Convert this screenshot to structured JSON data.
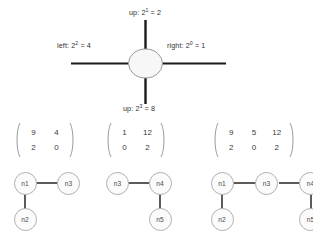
{
  "figure": {
    "hub": {
      "name": "center-node",
      "shape": "ellipse",
      "fill": "#f7f7f7",
      "stroke": "#9a9a9a"
    },
    "directions": [
      {
        "id": "up",
        "label": "up: 2",
        "exponent": "1",
        "equals": " = 2",
        "full_text": "up: 2¹ = 2"
      },
      {
        "id": "left",
        "label": "left: 2",
        "exponent": "2",
        "equals": " = 4",
        "full_text": "left: 2² = 4"
      },
      {
        "id": "right",
        "label": "right: 2",
        "exponent": "0",
        "equals": " = 1",
        "full_text": "right: 2⁰ = 1"
      },
      {
        "id": "down",
        "label": "up: 2",
        "exponent": "3",
        "equals": " = 8",
        "full_text": "up: 2³ = 8"
      }
    ],
    "arm_color": "#1a1a1a"
  },
  "matrices": [
    {
      "id": "matrix-1",
      "rows": 2,
      "cols": 2,
      "values": [
        [
          "9",
          "4"
        ],
        [
          "2",
          "0"
        ]
      ]
    },
    {
      "id": "matrix-2",
      "rows": 2,
      "cols": 2,
      "values": [
        [
          "1",
          "12"
        ],
        [
          "0",
          "2"
        ]
      ]
    },
    {
      "id": "matrix-3",
      "rows": 2,
      "cols": 3,
      "values": [
        [
          "9",
          "5",
          "12"
        ],
        [
          "2",
          "0",
          "2"
        ]
      ]
    }
  ],
  "graphs": [
    {
      "id": "graph-1",
      "nodes": [
        {
          "id": "g1-n1",
          "label": "n1"
        },
        {
          "id": "g1-n3",
          "label": "n3"
        },
        {
          "id": "g1-n2",
          "label": "n2"
        }
      ],
      "edges": [
        {
          "from": "n1",
          "to": "n3"
        },
        {
          "from": "n1",
          "to": "n2"
        }
      ]
    },
    {
      "id": "graph-2",
      "nodes": [
        {
          "id": "g2-n3",
          "label": "n3"
        },
        {
          "id": "g2-n4",
          "label": "n4"
        },
        {
          "id": "g2-n5",
          "label": "n5"
        }
      ],
      "edges": [
        {
          "from": "n3",
          "to": "n4"
        },
        {
          "from": "n4",
          "to": "n5"
        }
      ]
    },
    {
      "id": "graph-3",
      "nodes": [
        {
          "id": "g3-n1",
          "label": "n1"
        },
        {
          "id": "g3-n3",
          "label": "n3"
        },
        {
          "id": "g3-n4",
          "label": "n4"
        },
        {
          "id": "g3-n2",
          "label": "n2"
        },
        {
          "id": "g3-n5",
          "label": "n5"
        }
      ],
      "edges": [
        {
          "from": "n1",
          "to": "n3"
        },
        {
          "from": "n3",
          "to": "n4"
        },
        {
          "from": "n1",
          "to": "n2"
        },
        {
          "from": "n4",
          "to": "n5"
        }
      ]
    }
  ],
  "colors": {
    "node_fill": "#fbfbfb",
    "node_stroke": "#b0b0b0",
    "edge": "#333333",
    "text": "#2f2f2f",
    "background": "#ffffff"
  }
}
